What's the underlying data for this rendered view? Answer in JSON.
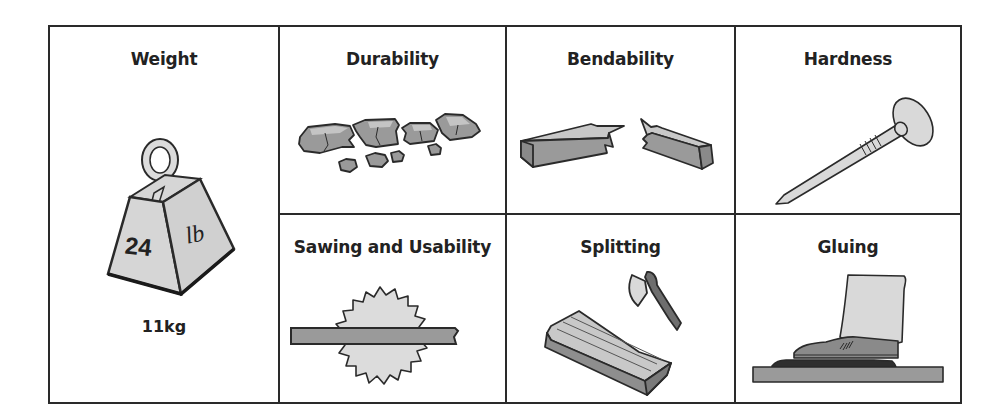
{
  "properties": {
    "weight": {
      "title": "Weight",
      "icon": "weight-icon",
      "weight_number": "24",
      "weight_unit": "lb",
      "metric": "11kg"
    },
    "durability": {
      "title": "Durability",
      "icon": "broken-rocks-icon"
    },
    "bendability": {
      "title": "Bendability",
      "icon": "broken-plank-icon"
    },
    "hardness": {
      "title": "Hardness",
      "icon": "nail-icon"
    },
    "sawing": {
      "title": "Sawing and Usability",
      "icon": "saw-blade-icon"
    },
    "splitting": {
      "title": "Splitting",
      "icon": "axe-and-log-icon"
    },
    "gluing": {
      "title": "Gluing",
      "icon": "glued-board-boot-icon"
    }
  },
  "colors": {
    "line": "#2a2a2a",
    "light_fill": "#d9d9d9",
    "mid_fill": "#9a9a9a",
    "dark_fill": "#3a3a3a"
  }
}
